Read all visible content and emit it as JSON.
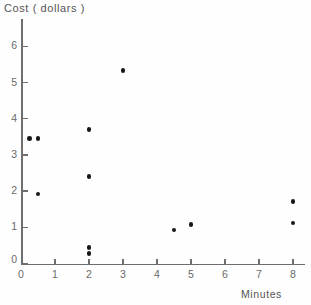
{
  "chart_data": {
    "type": "scatter",
    "title": "",
    "xlabel": "Minutes",
    "ylabel": "Cost ( dollars )",
    "xlim": [
      0,
      8
    ],
    "ylim": [
      0,
      6.3
    ],
    "grid": false,
    "legend": null,
    "xticks": [
      0,
      1,
      2,
      3,
      4,
      5,
      6,
      7,
      8
    ],
    "xtick_labels": [
      "0",
      "1",
      "2",
      "3",
      "4",
      "5",
      "6",
      "7",
      "8"
    ],
    "yticks": [
      0,
      1,
      2,
      3,
      4,
      5,
      6
    ],
    "ytick_labels": [
      "0",
      "1",
      "2",
      "3",
      "4",
      "5",
      "6"
    ],
    "marker_color": "#171717",
    "axis_color": "#6e6e6e",
    "points": [
      {
        "x": 0.25,
        "y": 3.45
      },
      {
        "x": 0.5,
        "y": 3.45
      },
      {
        "x": 0.5,
        "y": 1.92
      },
      {
        "x": 2.0,
        "y": 3.7
      },
      {
        "x": 2.0,
        "y": 2.4
      },
      {
        "x": 2.0,
        "y": 0.45
      },
      {
        "x": 2.0,
        "y": 0.27
      },
      {
        "x": 3.0,
        "y": 5.33
      },
      {
        "x": 4.5,
        "y": 0.92
      },
      {
        "x": 5.0,
        "y": 1.07
      },
      {
        "x": 8.0,
        "y": 1.72
      },
      {
        "x": 8.0,
        "y": 1.12
      }
    ]
  },
  "axes": {
    "y_title": "Cost ( dollars )",
    "x_title": "Minutes"
  }
}
